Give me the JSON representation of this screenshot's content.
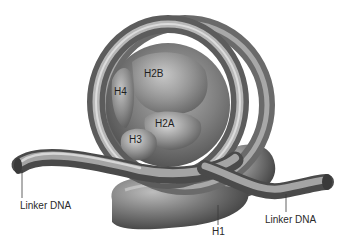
{
  "diagram": {
    "labels": {
      "h2b": "H2B",
      "h4": "H4",
      "h2a": "H2A",
      "h3": "H3",
      "h1": "H1",
      "linker_left": "Linker DNA",
      "linker_right": "Linker DNA"
    },
    "colors": {
      "background": "#ffffff",
      "dna_dark": "#4a4a4a",
      "dna_mid": "#8a8a8a",
      "dna_light": "#c4c4c4",
      "histone_core": "#7e7e7e",
      "label_text": "#2a2a2a",
      "leader_line": "#3a3a3a"
    }
  }
}
